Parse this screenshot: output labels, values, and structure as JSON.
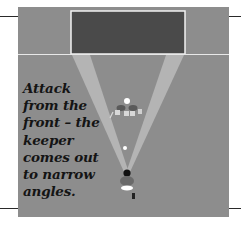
{
  "figure": {
    "caption": "Attack\nfrom the\nfront – the\nkeeper\ncomes out\nto narrow\nangles.",
    "colors": {
      "pitch": "#8d8d8d",
      "goal_fill": "#4a4a4a",
      "line_white": "#f2f2f2",
      "beam": "#b8b8b8",
      "text": "#141414"
    }
  }
}
